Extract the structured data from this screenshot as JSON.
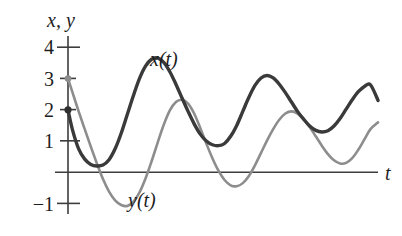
{
  "figure": {
    "background_color": "#ffffff",
    "axis_color": "#3d3d3d",
    "vertical_axis_title": "x, y",
    "horizontal_axis_title": "t"
  },
  "labels": {
    "curve_x_label": "x(t)",
    "curve_y_label": "y(t)",
    "tick_4": "4",
    "tick_3": "3",
    "tick_2": "2",
    "tick_1": "1",
    "tick_minus_1": "−1"
  },
  "chart_data": {
    "type": "line",
    "title": "",
    "subtitle": "",
    "xlabel": "t",
    "ylabel": "x, y",
    "grid": false,
    "legend": "inline-annotations",
    "xlim": [
      0,
      10
    ],
    "ylim": [
      -1.5,
      4.5
    ],
    "yticks": [
      4,
      3,
      2,
      1,
      0,
      -1
    ],
    "ytick_labels": [
      "4",
      "3",
      "2",
      "1",
      "",
      "−1"
    ],
    "xticks": [],
    "xtick_labels": [],
    "annotations": [
      {
        "text": "x(t)",
        "x": 3.0,
        "y": 3.55,
        "color": "#3a3a3a"
      },
      {
        "text": "y(t)",
        "x": 2.35,
        "y": -0.85,
        "color": "#8d8d8d"
      }
    ],
    "series": [
      {
        "name": "x(t)",
        "color": "#3a3a3a",
        "stroke_width": 3.4,
        "start_marker": {
          "x": 0.0,
          "y": 2.0
        },
        "x": [
          0.0,
          0.15,
          0.35,
          0.55,
          0.75,
          0.95,
          1.15,
          1.35,
          1.55,
          1.75,
          1.95,
          2.15,
          2.35,
          2.55,
          2.75,
          2.95,
          3.15,
          3.35,
          3.55,
          3.75,
          3.95,
          4.15,
          4.35,
          4.55,
          4.75,
          4.95,
          5.15,
          5.35,
          5.55,
          5.75,
          5.95,
          6.15,
          6.35,
          6.55,
          6.75,
          6.95,
          7.15,
          7.35,
          7.55,
          7.75,
          7.95,
          8.15,
          8.35,
          8.55,
          8.75,
          8.95,
          9.15,
          9.35,
          9.55,
          9.75,
          9.95,
          10.2
        ],
        "y": [
          2.0,
          1.35,
          0.75,
          0.42,
          0.25,
          0.2,
          0.23,
          0.4,
          0.75,
          1.25,
          1.85,
          2.45,
          3.0,
          3.4,
          3.62,
          3.66,
          3.52,
          3.22,
          2.82,
          2.38,
          1.95,
          1.55,
          1.22,
          1.0,
          0.88,
          0.85,
          0.92,
          1.15,
          1.5,
          1.95,
          2.4,
          2.78,
          3.02,
          3.1,
          3.02,
          2.82,
          2.55,
          2.25,
          1.95,
          1.7,
          1.48,
          1.34,
          1.29,
          1.33,
          1.48,
          1.72,
          2.02,
          2.32,
          2.58,
          2.75,
          2.8,
          2.3
        ]
      },
      {
        "name": "y(t)",
        "color": "#8d8d8d",
        "stroke_width": 2.6,
        "start_marker": {
          "x": 0.0,
          "y": 3.0
        },
        "x": [
          0.0,
          0.15,
          0.35,
          0.55,
          0.75,
          0.95,
          1.15,
          1.35,
          1.55,
          1.75,
          1.95,
          2.15,
          2.35,
          2.55,
          2.75,
          2.95,
          3.15,
          3.35,
          3.55,
          3.75,
          3.95,
          4.15,
          4.35,
          4.55,
          4.75,
          4.95,
          5.15,
          5.35,
          5.55,
          5.75,
          5.95,
          6.15,
          6.35,
          6.55,
          6.75,
          6.95,
          7.15,
          7.35,
          7.55,
          7.75,
          7.95,
          8.15,
          8.35,
          8.55,
          8.75,
          8.95,
          9.15,
          9.35,
          9.55,
          9.75,
          9.95,
          10.2
        ],
        "y": [
          3.0,
          2.55,
          1.95,
          1.38,
          0.82,
          0.28,
          -0.22,
          -0.62,
          -0.9,
          -1.05,
          -1.08,
          -0.95,
          -0.65,
          -0.2,
          0.35,
          0.95,
          1.52,
          1.98,
          2.25,
          2.32,
          2.2,
          1.88,
          1.42,
          0.92,
          0.45,
          0.05,
          -0.25,
          -0.42,
          -0.45,
          -0.35,
          -0.12,
          0.22,
          0.62,
          1.02,
          1.38,
          1.68,
          1.88,
          1.95,
          1.88,
          1.7,
          1.45,
          1.15,
          0.85,
          0.58,
          0.38,
          0.28,
          0.3,
          0.45,
          0.72,
          1.05,
          1.38,
          1.6
        ]
      }
    ]
  }
}
